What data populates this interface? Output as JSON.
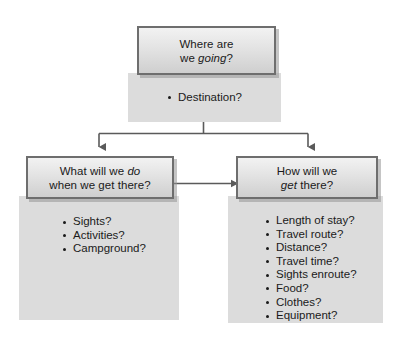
{
  "diagram": {
    "type": "hierarchy-tree",
    "background_color": "#ffffff",
    "panel_color": "#dcdcdc",
    "node_border_color": "#6e6e6e",
    "connector_color": "#5a5a5a",
    "text_color": "#1a1a1a"
  },
  "root": {
    "heading_line1": "Where are",
    "heading_line2_plain": "we ",
    "heading_line2_italic": "going",
    "heading_line2_tail": "?",
    "bullet": "Destination?"
  },
  "left_branch": {
    "heading_line1_plain": "What will we ",
    "heading_line1_italic": "do",
    "heading_line2": "when we get there?",
    "bullets": [
      "Sights?",
      "Activities?",
      "Campground?"
    ]
  },
  "right_branch": {
    "heading_line1": "How will we",
    "heading_line2_italic": "get",
    "heading_line2_tail": " there?",
    "bullets": [
      "Length of stay?",
      "Travel route?",
      "Distance?",
      "Travel time?",
      "Sights enroute?",
      "Food?",
      "Clothes?",
      "Equipment?"
    ]
  },
  "connectors": {
    "root_to_children": "tee-down-split",
    "left_right_link": "double-headed-horizontal-arrow"
  }
}
